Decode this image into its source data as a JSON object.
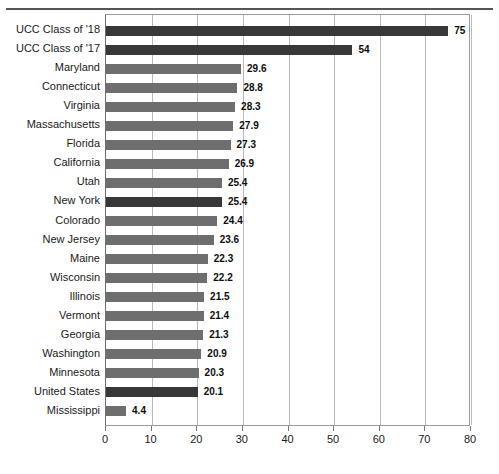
{
  "chart_data": {
    "type": "bar",
    "orientation": "horizontal",
    "title": "",
    "xlabel": "",
    "ylabel": "",
    "xlim": [
      0,
      80
    ],
    "xticks": [
      0,
      10,
      20,
      30,
      40,
      50,
      60,
      70,
      80
    ],
    "grid": true,
    "legend": null,
    "categories": [
      "UCC Class of '18",
      "UCC Class of '17",
      "Maryland",
      "Connecticut",
      "Virginia",
      "Massachusetts",
      "Florida",
      "California",
      "Utah",
      "New York",
      "Colorado",
      "New Jersey",
      "Maine",
      "Wisconsin",
      "Illinois",
      "Vermont",
      "Georgia",
      "Washington",
      "Minnesota",
      "United States",
      "Mississippi"
    ],
    "values": [
      75,
      54,
      29.6,
      28.8,
      28.3,
      27.9,
      27.3,
      26.9,
      25.4,
      25.4,
      24.4,
      23.6,
      22.3,
      22.2,
      21.5,
      21.4,
      21.3,
      20.9,
      20.3,
      20.1,
      4.4
    ],
    "value_labels": [
      "75",
      "54",
      "29.6",
      "28.8",
      "28.3",
      "27.9",
      "27.3",
      "26.9",
      "25.4",
      "25.4",
      "24.4",
      "23.6",
      "22.3",
      "22.2",
      "21.5",
      "21.4",
      "21.3",
      "20.9",
      "20.3",
      "20.1",
      "4.4"
    ],
    "highlighted": [
      "UCC Class of '18",
      "UCC Class of '17",
      "New York",
      "United States"
    ],
    "colors": {
      "bar": "#6e6e6e",
      "bar_highlight": "#383838",
      "gridline": "#b9b9b9",
      "axis": "#9a9a9a",
      "text": "#1a1a1a",
      "background": "#ffffff"
    }
  }
}
